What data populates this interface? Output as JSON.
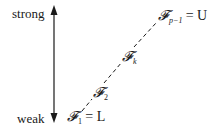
{
  "axis": {
    "top_label": "strong",
    "bottom_label": "weak"
  },
  "chain": {
    "items": [
      {
        "symbol": "𝓕",
        "subscript": "1",
        "equals": "= L"
      },
      {
        "symbol": "𝓕",
        "subscript": "2",
        "equals": ""
      },
      {
        "symbol": "𝓕",
        "subscript": "k",
        "equals": ""
      },
      {
        "symbol": "𝓕",
        "subscript": "p−1",
        "equals": "= U"
      }
    ]
  },
  "colors": {
    "ink": "#1a1a1a",
    "background": "#ffffff"
  }
}
